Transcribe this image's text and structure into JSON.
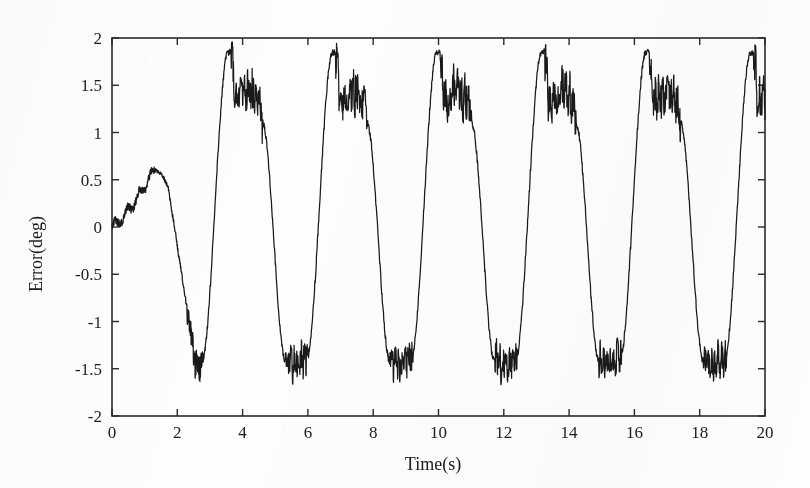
{
  "figure": {
    "background_color": "#fdfdfb",
    "line_color": "#1a1a1a",
    "axis_color": "#2a2a2a"
  },
  "chart_data": {
    "type": "line",
    "title": "",
    "xlabel": "Time(s)",
    "ylabel": "Error(deg)",
    "xlim": [
      0,
      20
    ],
    "ylim": [
      -2,
      2
    ],
    "grid": false,
    "legend": null,
    "xticks": [
      0,
      2,
      4,
      6,
      8,
      10,
      12,
      14,
      16,
      18,
      20
    ],
    "xtick_labels": [
      "0",
      "2",
      "4",
      "6",
      "8",
      "10",
      "12",
      "14",
      "16",
      "18",
      "20"
    ],
    "yticks": [
      -2,
      -1.5,
      -1,
      -0.5,
      0,
      0.5,
      1,
      1.5,
      2
    ],
    "ytick_labels": [
      "-2",
      "-1.5",
      "-1",
      "-0.5",
      "0",
      "0.5",
      "1",
      "1.5",
      "2"
    ],
    "tick_direction": "in",
    "series": [
      {
        "name": "tracking error",
        "description": "Periodic tracking error signal with superimposed high-frequency noise; initial transient rises to about 0.6 deg near t=1.3 s, then settles into a repeating cycle of period about 3.2 s with sharp positive spikes near 1.85 deg, jagged plateaus near 1.25-1.5 deg, and noisy negative troughs near -1.45 deg.",
        "period": 3.2,
        "peak_times": [
          3.65,
          6.85,
          9.95,
          13.1,
          16.3,
          19.4
        ],
        "peak_values": [
          1.85,
          1.78,
          1.78,
          1.76,
          1.74,
          1.72
        ],
        "trough_times": [
          2.4,
          5.45,
          8.6,
          11.75,
          14.95,
          18.1
        ],
        "trough_values": [
          -1.45,
          -1.47,
          -1.5,
          -1.52,
          -1.48,
          -1.6
        ],
        "start_value": 0.0,
        "end_value": 1.15,
        "transient_peak": {
          "time": 1.3,
          "value": 0.6
        },
        "noise_amplitude_peak": 0.27,
        "noise_amplitude_trough": 0.16,
        "noise_amplitude_slope": 0.035
      }
    ]
  }
}
